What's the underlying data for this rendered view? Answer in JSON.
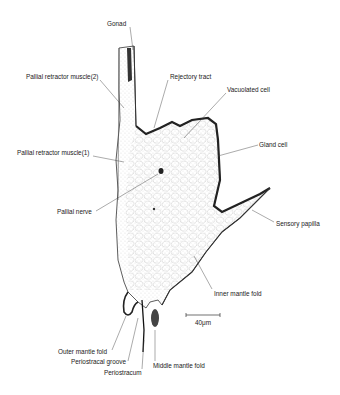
{
  "figure": {
    "type": "histological section drawing",
    "scale_bar": "40μm",
    "labels": [
      {
        "id": "gonad",
        "text": "Gonad",
        "x": 107,
        "y": 21
      },
      {
        "id": "pallial-retractor-muscle-2",
        "text": "Pallial retractor muscle(2)",
        "x": 26,
        "y": 74
      },
      {
        "id": "rejectory-tract",
        "text": "Rejectory tract",
        "x": 170,
        "y": 74
      },
      {
        "id": "vacuolated-cell",
        "text": "Vacuolated cell",
        "x": 227,
        "y": 87
      },
      {
        "id": "pallial-retractor-muscle-1",
        "text": "Pallial retractor muscle(1)",
        "x": 17,
        "y": 150
      },
      {
        "id": "gland-cell",
        "text": "Gland cell",
        "x": 259,
        "y": 142
      },
      {
        "id": "pallial-nerve",
        "text": "Pallial nerve",
        "x": 57,
        "y": 209
      },
      {
        "id": "sensory-papilla",
        "text": "Sensory papilla",
        "x": 276,
        "y": 221
      },
      {
        "id": "inner-mantle-fold",
        "text": "Inner mantle fold",
        "x": 214,
        "y": 291
      },
      {
        "id": "outer-mantle-fold",
        "text": "Outer mantle fold",
        "x": 58,
        "y": 349
      },
      {
        "id": "periostracal-groove",
        "text": "Periostracal groove",
        "x": 71,
        "y": 359
      },
      {
        "id": "middle-mantle-fold",
        "text": "Middle mantle fold",
        "x": 153,
        "y": 363
      },
      {
        "id": "periostracum",
        "text": "Periostracum",
        "x": 104,
        "y": 370
      }
    ]
  }
}
